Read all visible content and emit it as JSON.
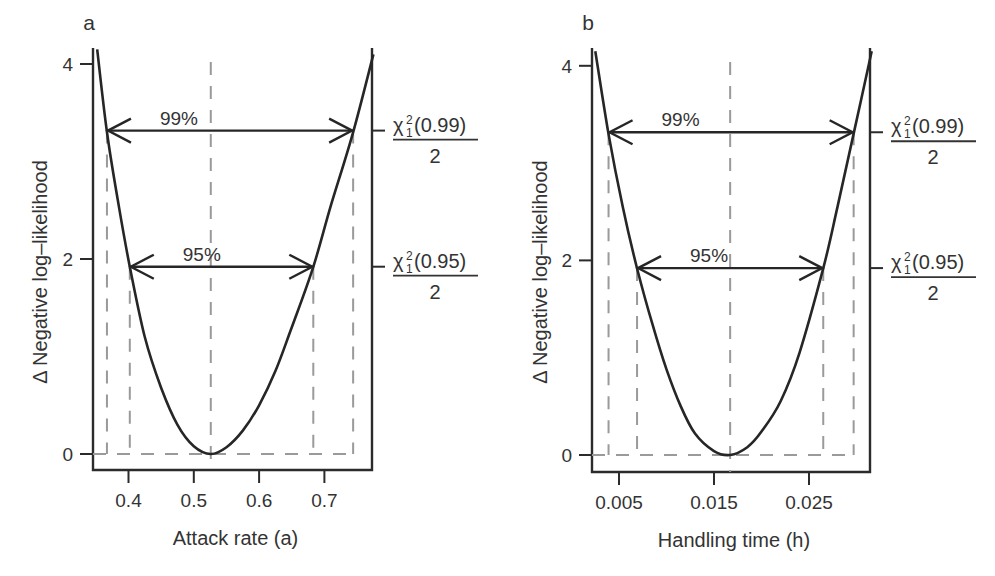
{
  "chart_data": [
    {
      "type": "line",
      "panel_label": "a",
      "title": "",
      "xlabel": "Attack rate (a)",
      "ylabel": "Δ Negative log–likelihood",
      "xticks": [
        "0.4",
        "0.5",
        "0.6",
        "0.7"
      ],
      "xtick_values": [
        0.4,
        0.5,
        0.6,
        0.7
      ],
      "yticks": [
        "0",
        "2",
        "4"
      ],
      "ytick_values": [
        0,
        2,
        4
      ],
      "xlim": [
        0.345,
        0.775
      ],
      "ylim": [
        0,
        4.2
      ],
      "grid": false,
      "mle": 0.526,
      "series": [
        {
          "name": "profile likelihood",
          "x": [
            0.352,
            0.367,
            0.385,
            0.402,
            0.425,
            0.45,
            0.475,
            0.5,
            0.526,
            0.55,
            0.575,
            0.6,
            0.625,
            0.65,
            0.683,
            0.71,
            0.744,
            0.775
          ],
          "y": [
            4.15,
            3.3,
            2.55,
            1.92,
            1.2,
            0.68,
            0.3,
            0.08,
            0.0,
            0.07,
            0.24,
            0.5,
            0.85,
            1.3,
            1.92,
            2.55,
            3.3,
            4.1
          ]
        }
      ],
      "intervals": [
        {
          "label": "99%",
          "level": 3.317,
          "lower": 0.367,
          "upper": 0.744,
          "threshold_label": {
            "symbol": "χ",
            "sub": "1",
            "sup": "2",
            "arg": "(0.99)",
            "den": "2"
          }
        },
        {
          "label": "95%",
          "level": 1.921,
          "lower": 0.402,
          "upper": 0.683,
          "threshold_label": {
            "symbol": "χ",
            "sub": "1",
            "sup": "2",
            "arg": "(0.95)",
            "den": "2"
          }
        }
      ]
    },
    {
      "type": "line",
      "panel_label": "b",
      "title": "",
      "xlabel": "Handling time (h)",
      "ylabel": "Δ Negative log–likelihood",
      "xticks": [
        "0.005",
        "0.015",
        "0.025"
      ],
      "xtick_values": [
        0.005,
        0.015,
        0.025
      ],
      "yticks": [
        "0",
        "2",
        "4"
      ],
      "ytick_values": [
        0,
        2,
        4
      ],
      "xlim": [
        0.0022,
        0.0316
      ],
      "ylim": [
        0,
        4.2
      ],
      "grid": false,
      "mle": 0.0167,
      "series": [
        {
          "name": "profile likelihood",
          "x": [
            0.0025,
            0.0039,
            0.0054,
            0.0069,
            0.0085,
            0.01,
            0.0115,
            0.013,
            0.015,
            0.0167,
            0.0185,
            0.02,
            0.022,
            0.024,
            0.0265,
            0.028,
            0.0297,
            0.0316
          ],
          "y": [
            4.15,
            3.3,
            2.55,
            1.92,
            1.35,
            0.88,
            0.5,
            0.22,
            0.04,
            0.0,
            0.08,
            0.24,
            0.55,
            1.05,
            1.92,
            2.55,
            3.3,
            4.15
          ]
        }
      ],
      "intervals": [
        {
          "label": "99%",
          "level": 3.317,
          "lower": 0.0039,
          "upper": 0.0297,
          "threshold_label": {
            "symbol": "χ",
            "sub": "1",
            "sup": "2",
            "arg": "(0.99)",
            "den": "2"
          }
        },
        {
          "label": "95%",
          "level": 1.921,
          "lower": 0.0069,
          "upper": 0.0265,
          "threshold_label": {
            "symbol": "χ",
            "sub": "1",
            "sup": "2",
            "arg": "(0.95)",
            "den": "2"
          }
        }
      ]
    }
  ],
  "colors": {
    "curve": "#262626",
    "axis": "#2b2b2b",
    "dashed_guides": "#9a9a9a",
    "text": "#333333"
  }
}
